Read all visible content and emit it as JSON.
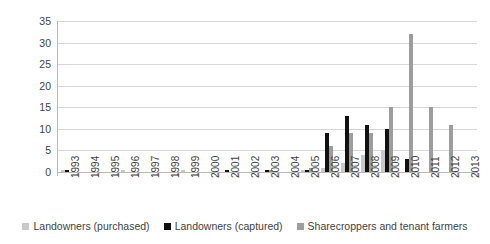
{
  "chart_data": {
    "type": "bar",
    "title": "",
    "subtitle": "",
    "xlabel": "",
    "ylabel": "",
    "ylim": [
      0,
      35
    ],
    "ytick_step": 5,
    "yticks": [
      "35",
      "30",
      "25",
      "20",
      "15",
      "10",
      "5",
      "0"
    ],
    "grid": true,
    "legend_position": "bottom",
    "categories": [
      "1993",
      "1994",
      "1995",
      "1996",
      "1997",
      "1998",
      "1999",
      "2000",
      "2001",
      "2002",
      "2003",
      "2004",
      "2005",
      "2006",
      "2007",
      "2008",
      "2009",
      "2010",
      "2011",
      "2012",
      "2013"
    ],
    "series": [
      {
        "name": "Landowners (purchased)",
        "color": "#c9c9c9",
        "values": [
          0.5,
          0,
          0,
          0.5,
          0,
          0,
          0.5,
          0,
          0,
          0,
          0,
          0,
          0.5,
          1,
          2,
          4,
          5,
          0,
          0,
          0,
          0
        ]
      },
      {
        "name": "Landowners (captured)",
        "color": "#111111",
        "values": [
          0.5,
          0,
          0,
          0,
          0,
          0,
          0,
          0,
          0.5,
          0,
          0.5,
          0,
          0.5,
          9,
          13,
          11,
          10,
          3,
          0,
          0,
          0
        ]
      },
      {
        "name": "Sharecroppers and tenant farmers",
        "color": "#9d9d9d",
        "values": [
          0,
          0,
          0,
          0,
          0,
          0,
          0,
          0,
          0,
          0,
          0.5,
          0,
          1,
          6,
          9,
          9,
          15,
          32,
          15,
          11,
          0
        ]
      }
    ]
  },
  "legend": {
    "items": [
      {
        "label": "Landowners (purchased)",
        "swatch": "square-gray-light-icon"
      },
      {
        "label": "Landowners (captured)",
        "swatch": "square-black-icon"
      },
      {
        "label": "Sharecroppers and tenant farmers",
        "swatch": "square-gray-icon"
      }
    ]
  }
}
